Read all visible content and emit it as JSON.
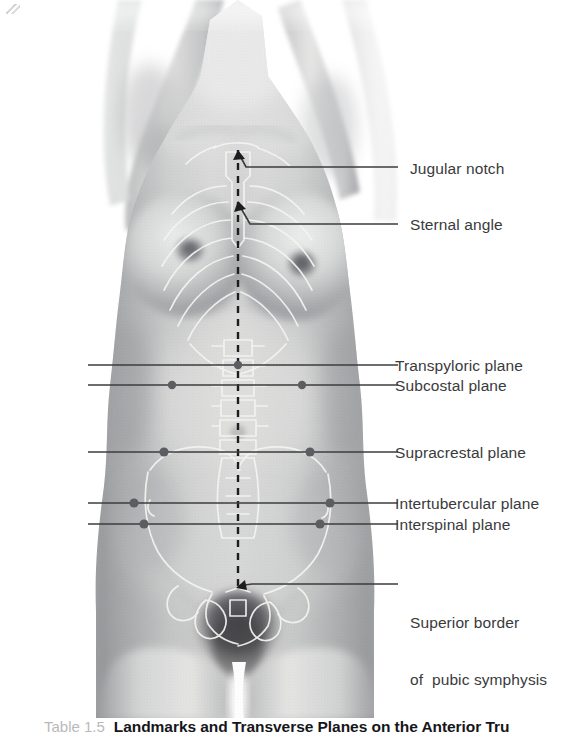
{
  "figure": {
    "type": "anatomical-photograph",
    "background_color": "#ffffff",
    "midline": {
      "name": "median-plane-dashed-line",
      "style": "dashed",
      "color": "#1d1d20"
    },
    "overlay_color": "#f2f2f0",
    "line_color": "#3c3c3e",
    "marker_color": "#5d5d61"
  },
  "labels": [
    {
      "id": "jugular-notch",
      "text": "Jugular notch",
      "text2": ""
    },
    {
      "id": "sternal-angle",
      "text": "Sternal angle",
      "text2": ""
    },
    {
      "id": "transpyloric-plane",
      "text": "Transpyloric plane",
      "text2": ""
    },
    {
      "id": "subcostal-plane",
      "text": "Subcostal plane",
      "text2": ""
    },
    {
      "id": "supracrestal-plane",
      "text": "Supracrestal plane",
      "text2": ""
    },
    {
      "id": "intertubercular-plane",
      "text": "Intertubercular plane",
      "text2": ""
    },
    {
      "id": "interspinal-plane",
      "text": "Interspinal plane",
      "text2": ""
    },
    {
      "id": "pubic-symphysis",
      "text": "Superior border",
      "text2": "of  pubic symphysis"
    }
  ],
  "caption": {
    "number": "Table 1.5",
    "title": "Landmarks and Transverse Planes on the Anterior Tru"
  }
}
